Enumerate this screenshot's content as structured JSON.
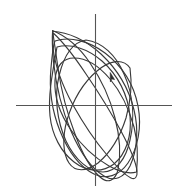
{
  "figure": {
    "background_color": "#ffffff",
    "width": 184,
    "height": 189
  },
  "axes": {
    "x_axis": {
      "name": "horizontal-axis",
      "color": "#555555",
      "x_start": 16,
      "x_end": 172,
      "y": 105.5
    },
    "y_axis": {
      "name": "vertical-axis",
      "color": "#555555",
      "y_start": 14,
      "y_end": 186,
      "x": 95.5
    },
    "origin": {
      "x": 95.5,
      "y": 105.5
    }
  },
  "marker": {
    "name": "direction-arrowhead",
    "x": 112,
    "y": 77,
    "color": "#2e2e2e",
    "points": "110.2,72.5 114.6,79.6 111.6,78.9 110.4,82.0"
  },
  "chart_data": {
    "type": "line",
    "title": "",
    "subtitle": "",
    "xlabel": "",
    "ylabel": "",
    "grid": false,
    "legend": false,
    "legend_position": "none",
    "axis_tick_labels": [],
    "annotations": [
      {
        "label": "direction-arrow",
        "x": 112,
        "y": 77
      }
    ],
    "xlim": [
      16,
      172
    ],
    "ylim": [
      14,
      186
    ],
    "series": [
      {
        "name": "orbit-loop-1",
        "stroke": "#3a3a3a",
        "path": "M 52.5 30.5 C 66 36 80 48 90 63 C 101 79 110 98 115 118 C 120 137 121 155 118 170 C 115 181 108 184 100 177 C 91 169 82 153 75 134 C 67 113 61 89 58 68 C 55.5 50 53.5 37 52.5 30.5 Z"
      },
      {
        "name": "orbit-loop-2",
        "stroke": "#3a3a3a",
        "path": "M 52.6 31.2 C 68 32 86 40 101 54 C 117 69 129 89 134 110 C 139 130 137 151 130 166 C 124 178 114 182 104 176 C 92 169 80 152 71 131 C 62 110 56 85 53.5 62 C 52.2 47 52.2 36 52.6 31.2 Z"
      },
      {
        "name": "orbit-loop-3",
        "stroke": "#3a3a3a",
        "path": "M 55 41 C 70 36 89 41 105 53 C 122 66 134 85 138 106 C 142 127 138 148 128 163 C 119 176 106 180 94 174 C 80 167 68 151 60 131 C 52 111 49 88 51 68 C 52.3 53 53.4 44.5 55 41 Z"
      },
      {
        "name": "orbit-loop-4",
        "stroke": "#3a3a3a",
        "path": "M 86 40 C 102 42 116 55 124 74 C 133 94 135 118 130 140 C 126 159 116 172 103 172 C 89 172 75 160 66 141 C 57 121 54 97 59 76 C 64 55 73 42 86 40 Z"
      },
      {
        "name": "orbit-loop-5",
        "stroke": "#3a3a3a",
        "path": "M 53.2 33 C 62 41 74 56 86 74 C 99 93 112 114 122 133 C 131 150 136 163 137 171 C 137.6 177 135 180 131 178 C 125 175 116 166 107 155 C 95 141 83 123 73 105 C 62 85 55 65 53 48 C 52.4 39 52.7 34.6 53.2 33 Z"
      },
      {
        "name": "orbit-loop-6",
        "stroke": "#3a3a3a",
        "path": "M 136.5 172 C 130 174 120 172 109 166 C 95 158 81 145 71 130 C 60 114 54 96 55 80 C 56 66 63 58 74 58 C 86 58 99 66 110 79 C 121 92 129 109 134 127 C 137.5 141 138 158 136.5 172 Z"
      },
      {
        "name": "orbit-loop-7",
        "stroke": "#3a3a3a",
        "path": "M 57 47 C 71 43 88 49 102 61 C 118 75 128 95 130 116 C 132 136 126 154 114 164 C 102 173 87 172 74 162 C 61 152 52 135 50 116 C 48 96 52 75 57 47 Z"
      },
      {
        "name": "orbit-loop-8",
        "stroke": "#3a3a3a",
        "path": "M 130 68 C 132 82 131 100 126 118 C 120 137 110 153 98 163 C 86 172 75 172 69 163 C 63 154 62 138 67 120 C 73 100 84 82 97 71 C 110 60 123 58 130 68 Z"
      }
    ]
  }
}
